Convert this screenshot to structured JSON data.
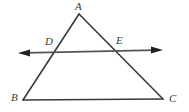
{
  "figure": {
    "background_color": "#ffffff",
    "stroke_color": "#3a3a3a",
    "line_color": "#555555",
    "label_color": "#3a3a3a",
    "labels": {
      "A": "A",
      "B": "B",
      "C": "C",
      "D": "D",
      "E": "E"
    },
    "icons": {
      "left_arrowhead": "arrow-left-icon",
      "right_arrowhead": "arrow-right-icon"
    },
    "geometry": {
      "points": {
        "A": [
          79,
          14
        ],
        "B": [
          23,
          100
        ],
        "C": [
          163,
          99
        ],
        "D": [
          54,
          52
        ],
        "E": [
          118,
          51
        ]
      },
      "triangle_sides": [
        {
          "name": "AB",
          "from": "A",
          "to": "B"
        },
        {
          "name": "AC",
          "from": "A",
          "to": "C"
        },
        {
          "name": "BC",
          "from": "B",
          "to": "C"
        }
      ],
      "transversal": {
        "name": "DE",
        "left_tip": [
          18,
          53
        ],
        "right_tip": [
          163,
          50
        ],
        "passes_through": [
          "D",
          "E"
        ],
        "double_arrow": true
      }
    }
  }
}
